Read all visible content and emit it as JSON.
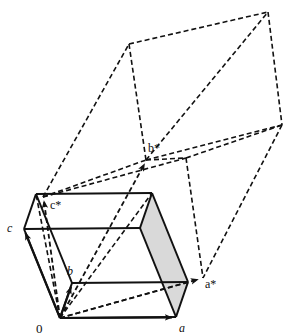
{
  "figure": {
    "background_color": "#ffffff",
    "line_color": "#111111",
    "shaded_face_color": "#d9d9d9",
    "solid_stroke_width": 2.0,
    "dashed_stroke_width": 1.6,
    "dash_pattern": "5,3"
  },
  "labels": {
    "origin": "0",
    "a": "a",
    "b": "b",
    "c": "c",
    "a_star": "a*",
    "b_star": "b*",
    "c_star": "c*"
  },
  "vectors": [
    {
      "name": "a",
      "label": "a",
      "kind": "direct",
      "from": [
        60,
        318
      ],
      "to": [
        176,
        317
      ]
    },
    {
      "name": "b",
      "label": "b",
      "kind": "direct",
      "from": [
        60,
        318
      ],
      "to": [
        72,
        283
      ]
    },
    {
      "name": "c",
      "label": "c",
      "kind": "direct",
      "from": [
        60,
        318
      ],
      "to": [
        24,
        229
      ]
    },
    {
      "name": "a*",
      "label": "a*",
      "kind": "reciprocal",
      "from": [
        60,
        318
      ],
      "to": [
        203,
        278
      ]
    },
    {
      "name": "b*",
      "label": "b*",
      "kind": "reciprocal",
      "from": [
        60,
        318
      ],
      "to": [
        146,
        160
      ]
    },
    {
      "name": "c*",
      "label": "c*",
      "kind": "reciprocal",
      "from": [
        60,
        318
      ],
      "to": [
        43,
        197
      ]
    }
  ],
  "label_positions": {
    "origin": [
      40,
      331
    ],
    "a": [
      180,
      330
    ],
    "b": [
      70,
      274
    ],
    "c": [
      10,
      229
    ],
    "a_star": [
      208,
      285
    ],
    "b_star": [
      150,
      150
    ],
    "c_star": [
      52,
      206
    ]
  },
  "direct_cell": {
    "type": "solid-parallelepiped",
    "description": "Direct-space unit cell drawn with solid lines; one face shaded grey",
    "vertices": {
      "O": [
        60,
        318
      ],
      "A": [
        176,
        317
      ],
      "B": [
        72,
        283
      ],
      "C": [
        24,
        229
      ],
      "AB": [
        188,
        282
      ],
      "AC": [
        140,
        228
      ],
      "BC": [
        36,
        194
      ],
      "ABC": [
        152,
        193
      ]
    },
    "shaded_face": [
      "A",
      "AB",
      "ABC",
      "AC"
    ]
  },
  "reciprocal_cell": {
    "type": "dashed-parallelepiped",
    "description": "Reciprocal-space unit cell drawn with dashed lines",
    "vertices": {
      "O": [
        60,
        318
      ],
      "As": [
        203,
        278
      ],
      "Bs": [
        146,
        160
      ],
      "Cs": [
        43,
        197
      ],
      "AsBs": [
        282,
        125
      ],
      "AsCs": [
        186,
        158
      ],
      "BsCs": [
        129,
        44
      ],
      "AsBsCs": [
        268,
        12
      ]
    }
  },
  "notes": {
    "shaded_face_note": "right-hand face of direct cell filled light grey",
    "arrowheads": "solid filled triangular arrowheads at vector tips"
  }
}
